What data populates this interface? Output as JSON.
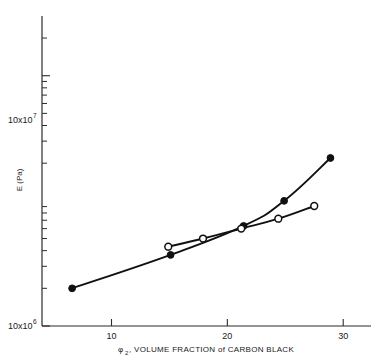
{
  "chart_data": {
    "type": "line",
    "title": "",
    "xlabel": "φ₂, VOLUME FRACTION of CARBON BLACK",
    "xlabel_symbol": "φ",
    "xlabel_subscript": "2",
    "xlabel_rest": ", VOLUME FRACTION of CARBON BLACK",
    "ylabel": "E (Pa)",
    "xscale": "linear",
    "yscale": "log",
    "xlim": [
      4.0,
      32.4
    ],
    "ylim": [
      1000000.0,
      300000000.0
    ],
    "xticks": [
      10,
      20,
      30
    ],
    "xticklabels": [
      "10",
      "20",
      "30"
    ],
    "yticks": [
      1000000,
      100000000
    ],
    "yticklabels": [
      "10x10",
      "10x10"
    ],
    "ytick_exponents": [
      "6",
      "7"
    ],
    "ytick_major_labels": [
      {
        "value": 100000000,
        "mantissa": "10x10",
        "exponent": "7"
      },
      {
        "value": 1000000,
        "mantissa": "10x10",
        "exponent": "6"
      }
    ],
    "yminorticks": [
      2000000,
      3000000,
      4000000,
      5000000,
      6000000,
      7000000,
      8000000,
      9000000,
      20000000,
      30000000,
      40000000,
      50000000,
      60000000,
      70000000,
      80000000,
      90000000,
      200000000
    ],
    "grid": false,
    "legend": "none",
    "series": [
      {
        "name": "filled-circles",
        "marker": "filled-circle",
        "x": [
          6.6,
          15.1,
          21.4,
          24.9,
          28.9
        ],
        "y": [
          2000000,
          3700000,
          6300000,
          10000000,
          22000000
        ]
      },
      {
        "name": "open-circles",
        "marker": "open-circle",
        "x": [
          14.9,
          17.9,
          21.2,
          24.4,
          27.5
        ],
        "y": [
          4300000,
          5000000,
          6000000,
          7200000,
          9100000
        ]
      }
    ]
  },
  "figure": {
    "axis_color": "#2b2b2b",
    "line_color": "#101010",
    "background": "#ffffff"
  }
}
